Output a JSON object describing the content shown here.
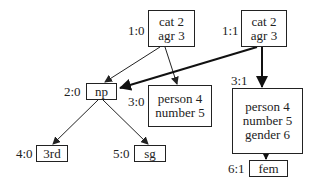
{
  "nodes": {
    "n10": {
      "id": "1:0",
      "lines": [
        "cat 2",
        "agr 3"
      ]
    },
    "n11": {
      "id": "1:1",
      "lines": [
        "cat 2",
        "agr 3"
      ]
    },
    "n20": {
      "id": "2:0",
      "lines": [
        "np"
      ]
    },
    "n30": {
      "id": "3:0",
      "lines": [
        "person 4",
        "number 5"
      ]
    },
    "n31": {
      "id": "3:1",
      "lines": [
        "person 4",
        "number 5",
        "gender 6"
      ]
    },
    "n40": {
      "id": "4:0",
      "lines": [
        "3rd"
      ]
    },
    "n50": {
      "id": "5:0",
      "lines": [
        "sg"
      ]
    },
    "n61": {
      "id": "6:1",
      "lines": [
        "fem"
      ]
    }
  },
  "edges": [
    {
      "from": "1:0",
      "to": "2:0",
      "style": "thin"
    },
    {
      "from": "1:0",
      "to": "3:0",
      "style": "thin"
    },
    {
      "from": "1:1",
      "to": "2:0",
      "style": "bold"
    },
    {
      "from": "1:1",
      "to": "3:1",
      "style": "bold"
    },
    {
      "from": "2:0",
      "to": "4:0",
      "style": "thin"
    },
    {
      "from": "2:0",
      "to": "5:0",
      "style": "thin"
    },
    {
      "from": "3:1",
      "to": "6:1",
      "style": "bold"
    }
  ]
}
